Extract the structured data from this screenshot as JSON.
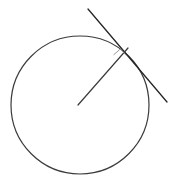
{
  "figure": {
    "width": 179,
    "height": 188,
    "background_color": "#ffffff"
  },
  "colors": {
    "circle_stroke": "#3b3b3b",
    "tangent_stroke": "#262626",
    "radius_stroke": "#3b3b3b",
    "right_angle_stroke": "#9a9a9a"
  },
  "chart_data": {
    "type": "diagram",
    "xlabel": "",
    "ylabel": "",
    "grid": false,
    "legend": false,
    "xlim": [
      0,
      179
    ],
    "ylim": [
      0,
      188
    ],
    "elements": [
      {
        "name": "circle",
        "kind": "circle",
        "center_x": 80,
        "center_y": 105,
        "radius": 69,
        "stroke_width": 1.2
      },
      {
        "name": "tangent-line",
        "kind": "line",
        "x1": 88,
        "y1": 9,
        "x2": 167,
        "y2": 102,
        "stroke_width": 1.3
      },
      {
        "name": "radius-line",
        "kind": "line",
        "x1": 78,
        "y1": 105,
        "x2": 128,
        "y2": 48,
        "stroke_width": 1.2
      },
      {
        "name": "right-angle-marker",
        "kind": "polyline",
        "points": "113.9,54.6 120.4,48.9 126.2,55.4",
        "stroke_width": 1.0
      }
    ],
    "points": [
      {
        "name": "center",
        "x": 80,
        "y": 105
      },
      {
        "name": "point-of-tangency",
        "x": 128,
        "y": 48
      }
    ],
    "annotations": []
  }
}
